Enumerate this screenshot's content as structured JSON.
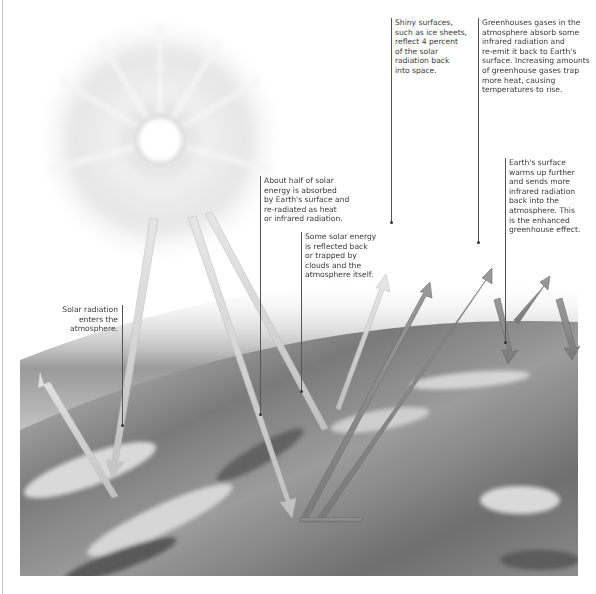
{
  "colors": {
    "background": "#ffffff",
    "text": "#3a3a3a",
    "leader_line": "#555555",
    "solar_arrow": "#d4d4d4",
    "infrared_arrow": "#8a8a8a"
  },
  "annotations": [
    {
      "id": "solar-entry",
      "text": "Solar radiation\nenters the\natmosphere."
    },
    {
      "id": "absorbed",
      "text": "About half of solar\nenergy is absorbed\nby Earth's surface and\nre-radiated as heat\nor infrared radiation."
    },
    {
      "id": "reflected-clouds",
      "text": "Some solar energy\nis reflected back\nor trapped by\nclouds and the\natmosphere itself."
    },
    {
      "id": "shiny-surfaces",
      "text": "Shiny surfaces,\nsuch as ice sheets,\nreflect 4 percent\nof the solar\nradiation back\ninto space."
    },
    {
      "id": "greenhouse-gases",
      "text": "Greenhouses gases in the\natmosphere absorb some\ninfrared radiation and\nre-emit it back to Earth's\nsurface. Increasing amounts\nof greenhouse gases trap\nmore heat, causing\ntemperatures to rise."
    },
    {
      "id": "enhanced-effect",
      "text": "Earth's surface\nwarms up further\nand sends more\ninfrared radiation\nback into the\natmosphere. This\nis the enhanced\ngreenhouse effect."
    }
  ],
  "icons": {
    "sun": "sun-icon",
    "earth": "earth-surface"
  }
}
